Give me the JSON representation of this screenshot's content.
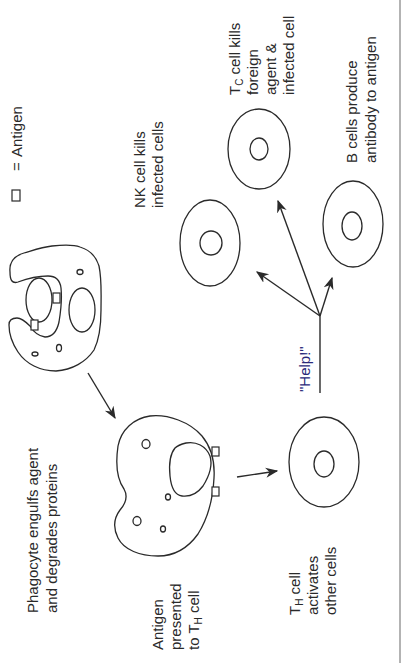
{
  "diagram": {
    "legend": {
      "symbol": "square",
      "equals": "=",
      "label": "Antigen"
    },
    "labels": {
      "phagocyte": [
        "Phagocyte engulfs agent",
        "and degrades proteins"
      ],
      "antigen_presented": [
        "Antigen",
        "presented",
        "to T",
        "H",
        " cell"
      ],
      "th_cell": [
        "T",
        "H",
        " cell",
        "activates",
        "other cells"
      ],
      "help": "\"Help!\"",
      "nk_cell": [
        "NK cell kills",
        "infected cells"
      ],
      "tc_cell": [
        "T",
        "C",
        "  cell kills",
        "foreign",
        "agent &",
        "infected cell"
      ],
      "b_cells": [
        "B cells produce",
        "antibody to antigen"
      ]
    },
    "nodes": [
      {
        "id": "phagocyte-engulfing",
        "type": "phagocyte"
      },
      {
        "id": "antigen-presenting-cell",
        "type": "phagocyte"
      },
      {
        "id": "th-cell",
        "type": "T helper cell"
      },
      {
        "id": "nk-cell",
        "type": "NK cell"
      },
      {
        "id": "tc-cell",
        "type": "cytotoxic T cell"
      },
      {
        "id": "b-cell",
        "type": "B cell"
      }
    ],
    "edges": [
      {
        "from": "phagocyte-engulfing",
        "to": "antigen-presenting-cell"
      },
      {
        "from": "antigen-presenting-cell",
        "to": "th-cell"
      },
      {
        "from": "th-cell",
        "to": "nk-cell",
        "label": "\"Help!\""
      },
      {
        "from": "th-cell",
        "to": "tc-cell",
        "label": "\"Help!\""
      },
      {
        "from": "th-cell",
        "to": "b-cell",
        "label": "\"Help!\""
      }
    ],
    "colors": {
      "line": "#2a2a2a",
      "help_text": "#2a2a7a",
      "border": "#9a9a9a",
      "background": "#ffffff"
    }
  }
}
